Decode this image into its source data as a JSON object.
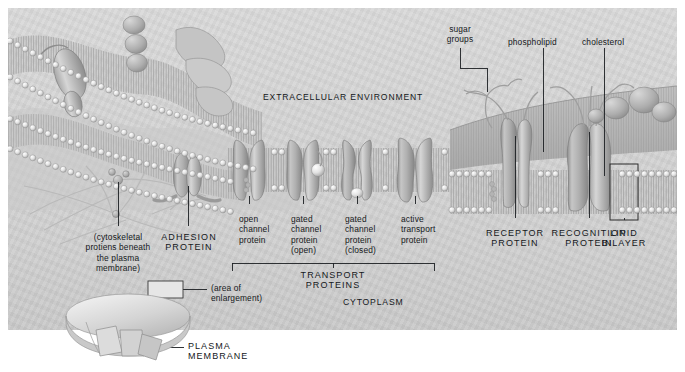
{
  "figure": {
    "panel_bg": "#d4d4d4",
    "ink": "#15181b"
  },
  "environment_labels": {
    "extracellular": "EXTRACELLULAR ENVIRONMENT",
    "cytoplasm": "CYTOPLASM"
  },
  "top_labels": {
    "sugar_groups": "sugar\ngroups",
    "phospholipid": "phospholipid",
    "cholesterol": "cholesterol"
  },
  "transport_proteins": {
    "bracket_label": "TRANSPORT\nPROTEINS",
    "items": [
      {
        "name": "open-channel-protein",
        "label": "open\nchannel\nprotein"
      },
      {
        "name": "gated-channel-protein-open",
        "label": "gated\nchannel\nprotein\n(open)"
      },
      {
        "name": "gated-channel-protein-closed",
        "label": "gated\nchannel\nprotein\n(closed)"
      },
      {
        "name": "active-transport-protein",
        "label": "active\ntransport\nprotein"
      }
    ]
  },
  "right_labels": [
    {
      "name": "receptor-protein",
      "label": "RECEPTOR\nPROTEIN"
    },
    {
      "name": "recognition-protein",
      "label": "RECOGNITION\nPROTEIN"
    },
    {
      "name": "lipid-bilayer",
      "label": "LIPID\nBILAYER"
    }
  ],
  "left_labels": {
    "cytoskeletal": "(cytoskeletal\nprotiens beneath\nthe plasma\nmembrane)",
    "adhesion_protein": "ADHESION\nPROTEIN"
  },
  "inset": {
    "area_of_enlargement": "(area of\nenlargement)",
    "plasma_membrane": "PLASMA\nMEMBRANE"
  }
}
